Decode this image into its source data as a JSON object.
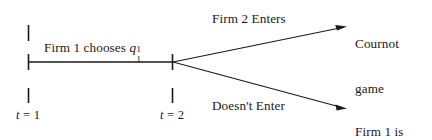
{
  "figure": {
    "type": "game-theory-timeline-diagram",
    "title_text": "",
    "background_color": "#ffffff",
    "ink_color": "#1a1a1a"
  },
  "timeline": {
    "action_label": {
      "prefix": "Firm 1 chooses ",
      "variable": "q",
      "subscript": "1",
      "superscript": "1"
    },
    "periods": [
      {
        "name": "t = 1",
        "var": "t",
        "eq": " = ",
        "value": "1"
      },
      {
        "name": "t = 2",
        "var": "t",
        "eq": " = ",
        "value": "2"
      }
    ]
  },
  "branches": [
    {
      "id": "enter",
      "label": "Firm 2 Enters",
      "outcome_line1": "Cournot",
      "outcome_line2": "game"
    },
    {
      "id": "does-not-enter",
      "label": "Doesn't Enter",
      "outcome_line1": "Firm 1 is",
      "outcome_line2": "a monopoly"
    }
  ],
  "geometry": {
    "axis_y": 62,
    "axis_x_start": 28,
    "axis_x_end": 172,
    "branch_node_x": 172,
    "branch_node_y": 62,
    "arrow_top_end_x": 346,
    "arrow_top_end_y": 27,
    "arrow_bottom_end_x": 346,
    "arrow_bottom_end_y": 108
  }
}
